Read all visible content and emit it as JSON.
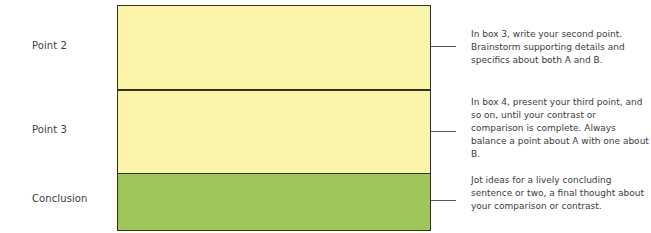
{
  "colors": {
    "point_fill": "#f9f4a8",
    "conclusion_fill": "#9fc45a",
    "border": "#333323",
    "text": "#3c3c3c"
  },
  "rows": [
    {
      "label": "Point 2",
      "fill": "yellow",
      "note": "In box 3, write your second point. Brainstorm supporting details and specifics about both A and B."
    },
    {
      "label": "Point 3",
      "fill": "yellow",
      "note": "In box 4, present your third point, and so on, until your contrast or comparison is complete. Always balance a point about A with one about B."
    },
    {
      "label": "Conclusion",
      "fill": "green",
      "note": "Jot ideas for a lively concluding sentence or two, a final thought about your comparison or contrast."
    }
  ]
}
